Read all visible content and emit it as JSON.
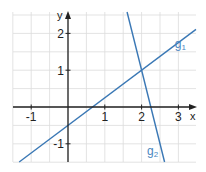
{
  "chart_data": {
    "type": "line",
    "title": "",
    "xlabel": "x",
    "ylabel": "y",
    "xlim": [
      -1.5,
      3.5
    ],
    "ylim": [
      -1.5,
      2.6
    ],
    "grid": true,
    "grid_step": 0.5,
    "x_ticks": [
      {
        "value": -1,
        "label": "-1"
      },
      {
        "value": 1,
        "label": "1"
      },
      {
        "value": 2,
        "label": "2"
      },
      {
        "value": 3,
        "label": "3"
      }
    ],
    "y_ticks": [
      {
        "value": 2,
        "label": "2"
      },
      {
        "value": 1,
        "label": "1"
      },
      {
        "value": -1,
        "label": "-1"
      }
    ],
    "series": [
      {
        "name": "g1",
        "label_main": "g",
        "label_sub": "1",
        "slope": 0.75,
        "intercept": -0.5,
        "label_at": [
          2.9,
          1.6
        ],
        "color": "#3a78b5"
      },
      {
        "name": "g2",
        "label_main": "g",
        "label_sub": "2",
        "slope": -4,
        "intercept": 9,
        "label_at": [
          2.15,
          -1.3
        ],
        "color": "#3a78b5"
      }
    ],
    "intersection": [
      2,
      1
    ],
    "colors": {
      "grid": "#dcdcdc",
      "axis": "#222222",
      "label": "#4a86c0"
    }
  }
}
